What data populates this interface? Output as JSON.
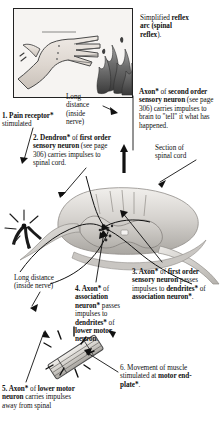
{
  "figure": {
    "title_plain_1": "Simplified ",
    "title_bold_1": "reflex",
    "title_plain_2": " ",
    "title_bold_2": "arc (spinal",
    "title_bold_3": "reflex",
    "title_plain_3": ")."
  },
  "labels": {
    "title": {
      "line1_plain": "Simplified ",
      "line1_bold": "reflex",
      "line2_bold": "arc (spinal",
      "line3_bold": "reflex",
      "line3_plain": ")."
    },
    "axon_second_order": {
      "number": "",
      "bold1": "Axon*",
      "plain1": " of ",
      "bold2": "second order sensory neuron",
      "plain2": " (see page 306) carries impulses to brain to \"tell\" it what has happened."
    },
    "long_distance_top": {
      "line1": "Long",
      "line2": "distance",
      "line3": "(inside",
      "line4": "nerve)"
    },
    "pain_receptor": {
      "number": "1. ",
      "bold": "Pain receptor*",
      "plain": " stimulated"
    },
    "dendron_first_order": {
      "number": "2. ",
      "bold1": "Dendron*",
      "plain1": " of ",
      "bold2": "first order sensory neuron",
      "plain2": " (see page 306) carries impulses to spinal cord."
    },
    "section_spinal_cord": {
      "line1": "Section of",
      "line2": "spinal cord"
    },
    "long_distance_bottom": {
      "line1": "Long distance",
      "line2": "(inside nerve)"
    },
    "axon_association": {
      "number": "4. ",
      "bold1": "Axon*",
      "plain1": " of ",
      "bold2": "association neuron*",
      "plain2": " passes impulses to ",
      "bold3": "dendrites*",
      "plain3": " of ",
      "bold4": "lower motor neuron",
      "plain4": "."
    },
    "axon_first_order": {
      "number": "3. ",
      "bold1": "Axon*",
      "plain1": " of ",
      "bold2": "first order sensory neuron",
      "plain2": " passes impulses to ",
      "bold3": "dendrites*",
      "plain3": " of ",
      "bold4": "association neuron*",
      "plain4": "."
    },
    "axon_lower_motor": {
      "number": "5. ",
      "bold1": "Axon*",
      "plain1": " of ",
      "bold2": "lower motor neuron",
      "plain2": " carries impulses away from spinal"
    },
    "movement_muscle": {
      "number": "6. ",
      "plain1": "Movement of muscle stimulated at ",
      "bold1": "motor end-plate*",
      "plain2": "."
    }
  },
  "colors": {
    "ink": "#111111",
    "panel_border": "#222222",
    "cord_light": "#e8e6e3",
    "cord_mid": "#b9b6b2",
    "cord_dark": "#8f8c88",
    "cord_grey": "#cfcdc9",
    "skin": "#e4ded8",
    "flame_dark": "#4a4a4a"
  },
  "icons": {
    "hand": "hand-icon",
    "flame": "flame-icon",
    "spinal_cord": "spinal-cord-icon",
    "muscle": "muscle-fiber-icon",
    "receptor": "pain-receptor-icon",
    "arrow": "arrow-icon"
  }
}
